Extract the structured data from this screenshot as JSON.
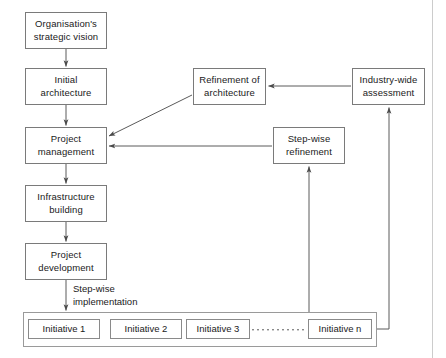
{
  "diagram": {
    "colors": {
      "box_border": "#7a7a7a",
      "container_border": "#9a9a9a",
      "edge": "#5a5a5a",
      "text": "#1a1a1a",
      "background": "#ffffff"
    },
    "nodes": [
      {
        "id": "strategic-vision",
        "label": "Organisation's\nstrategic vision",
        "x": 25,
        "y": 12,
        "w": 82,
        "h": 37
      },
      {
        "id": "initial-architecture",
        "label": "Initial\narchitecture",
        "x": 25,
        "y": 68,
        "w": 82,
        "h": 37
      },
      {
        "id": "project-management",
        "label": "Project\nmanagement",
        "x": 25,
        "y": 127,
        "w": 82,
        "h": 37
      },
      {
        "id": "infrastructure-building",
        "label": "Infrastructure\nbuilding",
        "x": 25,
        "y": 185,
        "w": 82,
        "h": 37
      },
      {
        "id": "project-development",
        "label": "Project\ndevelopment",
        "x": 25,
        "y": 243,
        "w": 82,
        "h": 37
      },
      {
        "id": "refinement-of-architecture",
        "label": "Refinement of\narchitecture",
        "x": 193,
        "y": 68,
        "w": 73,
        "h": 37
      },
      {
        "id": "industry-wide-assessment",
        "label": "Industry-wide\nassessment",
        "x": 352,
        "y": 68,
        "w": 73,
        "h": 37
      },
      {
        "id": "step-wise-refinement",
        "label": "Step-wise\nrefinement",
        "x": 273,
        "y": 127,
        "w": 72,
        "h": 37
      }
    ],
    "container": {
      "id": "initiatives-container",
      "x": 23,
      "y": 312,
      "w": 354,
      "h": 35
    },
    "initiatives": [
      {
        "id": "initiative-1",
        "label": "Initiative 1",
        "x": 28,
        "y": 319,
        "w": 72,
        "h": 20
      },
      {
        "id": "initiative-2",
        "label": "Initiative 2",
        "x": 110,
        "y": 319,
        "w": 72,
        "h": 20
      },
      {
        "id": "initiative-3",
        "label": "Initiative 3",
        "x": 186,
        "y": 319,
        "w": 64,
        "h": 20
      },
      {
        "id": "initiative-n",
        "label": "Initiative n",
        "x": 308,
        "y": 319,
        "w": 64,
        "h": 20
      }
    ],
    "ellipsis": {
      "id": "initiatives-ellipsis",
      "label": "...........",
      "dots": 11,
      "x1": 256,
      "x2": 302,
      "y": 330
    },
    "edge_labels": [
      {
        "id": "step-wise-implementation-label",
        "label": "Step-wise\nimplementation",
        "x": 73,
        "y": 283
      }
    ],
    "edges": [
      {
        "id": "vision-to-initial",
        "from": "strategic-vision",
        "to": "initial-architecture"
      },
      {
        "id": "initial-to-management",
        "from": "initial-architecture",
        "to": "project-management"
      },
      {
        "id": "management-to-infrastructure",
        "from": "project-management",
        "to": "infrastructure-building"
      },
      {
        "id": "infrastructure-to-development",
        "from": "infrastructure-building",
        "to": "project-development"
      },
      {
        "id": "development-to-initiatives",
        "from": "project-development",
        "to": "initiatives-container"
      },
      {
        "id": "refinement-to-management",
        "from": "refinement-of-architecture",
        "to": "project-management"
      },
      {
        "id": "industry-to-refinement",
        "from": "industry-wide-assessment",
        "to": "refinement-of-architecture"
      },
      {
        "id": "stepwise-refinement-to-management",
        "from": "step-wise-refinement",
        "to": "project-management"
      },
      {
        "id": "initiatives-to-stepwise-refinement",
        "from": "initiatives-container",
        "to": "step-wise-refinement"
      },
      {
        "id": "initiatives-to-industry",
        "from": "initiatives-container",
        "to": "industry-wide-assessment"
      }
    ]
  }
}
